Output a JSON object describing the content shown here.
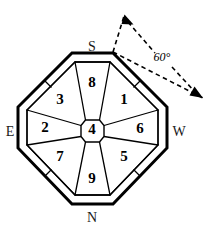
{
  "figure": {
    "type": "octagonal-partition-diagram",
    "background_color": "#ffffff",
    "stroke_color": "#000000",
    "outer_stroke_width": 3,
    "inner_stroke_width": 1.2,
    "width": 212,
    "height": 226
  },
  "regions": [
    {
      "id": "region-1",
      "label": "1",
      "position": "upper-right",
      "x": 124,
      "y": 101
    },
    {
      "id": "region-2",
      "label": "2",
      "position": "left",
      "x": 45,
      "y": 129
    },
    {
      "id": "region-3",
      "label": "3",
      "position": "upper-left",
      "x": 60,
      "y": 101
    },
    {
      "id": "region-4",
      "label": "4",
      "position": "center",
      "x": 92,
      "y": 131
    },
    {
      "id": "region-5",
      "label": "5",
      "position": "lower-right",
      "x": 124,
      "y": 158
    },
    {
      "id": "region-6",
      "label": "6",
      "position": "right",
      "x": 140,
      "y": 130
    },
    {
      "id": "region-7",
      "label": "7",
      "position": "lower-left",
      "x": 60,
      "y": 158
    },
    {
      "id": "region-8",
      "label": "8",
      "position": "top",
      "x": 92,
      "y": 84
    },
    {
      "id": "region-9",
      "label": "9",
      "position": "bottom",
      "x": 92,
      "y": 180
    }
  ],
  "compass": {
    "north": {
      "label": "N",
      "x": 92,
      "y": 219,
      "position": "bottom"
    },
    "south": {
      "label": "S",
      "x": 92,
      "y": 48,
      "position": "top"
    },
    "east": {
      "label": "E",
      "x": 10,
      "y": 133,
      "position": "left"
    },
    "west": {
      "label": "W",
      "x": 179,
      "y": 133,
      "position": "right"
    }
  },
  "annotation": {
    "angle_label": "60°",
    "angle_value": 60,
    "unit": "degrees",
    "label_x": 162,
    "label_y": 58,
    "style": "dashed-double-arrow",
    "vertex_x": 113,
    "vertex_y": 52
  }
}
